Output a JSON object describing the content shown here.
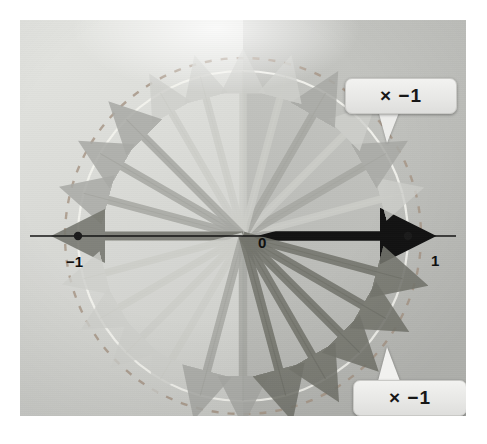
{
  "figure": {
    "title_visible": false,
    "axis_labels": {
      "negative_one": "−1",
      "zero": "0",
      "one": "1"
    },
    "callouts": [
      {
        "name": "top",
        "text": "× −1"
      },
      {
        "name": "bottom",
        "text": "× −1"
      }
    ],
    "colors": {
      "background_left": "#dcddd9",
      "background_right": "#bfc0bc",
      "axis": "#1a1a1a",
      "unit_circle": "#f0f0ec",
      "dashed_circle": "#b9a89c",
      "vector_light": "#cfd0cc",
      "vector_mid": "#a9aaa6",
      "vector_dark": "#6f706c",
      "vector_black": "#121212",
      "callout_fill": "#ececea",
      "marker": "#1a1a1a"
    },
    "geometry": {
      "origin_x": 243,
      "origin_y": 236,
      "radius": 165,
      "dashed_radius": 178
    }
  },
  "chart_data": {
    "type": "scatter",
    "title": "",
    "subtitle": "",
    "xlabel": "",
    "ylabel": "",
    "xlim": [
      -1.25,
      1.25
    ],
    "ylim": [
      -1.25,
      1.25
    ],
    "grid": false,
    "legend_position": "none",
    "tick_labels_x": [
      "−1",
      "0",
      "1"
    ],
    "tick_values_x": [
      -1,
      0,
      1
    ],
    "unit_circle_radius": 1.0,
    "dashed_circle_radius": 1.08,
    "marker_points": [
      {
        "label": "−1",
        "x": -1,
        "y": 0
      },
      {
        "label": "1",
        "x": 1,
        "y": 0
      }
    ],
    "vectors": [
      {
        "angle_deg": 0,
        "magnitude": 1.0,
        "shade": "black"
      },
      {
        "angle_deg": 15,
        "magnitude": 1.0,
        "shade": "light"
      },
      {
        "angle_deg": 30,
        "magnitude": 1.0,
        "shade": "mid"
      },
      {
        "angle_deg": 45,
        "magnitude": 1.0,
        "shade": "light"
      },
      {
        "angle_deg": 60,
        "magnitude": 1.0,
        "shade": "mid"
      },
      {
        "angle_deg": 75,
        "magnitude": 1.0,
        "shade": "light"
      },
      {
        "angle_deg": 90,
        "magnitude": 1.0,
        "shade": "light"
      },
      {
        "angle_deg": 105,
        "magnitude": 1.0,
        "shade": "light"
      },
      {
        "angle_deg": 120,
        "magnitude": 1.0,
        "shade": "light"
      },
      {
        "angle_deg": 135,
        "magnitude": 1.0,
        "shade": "mid"
      },
      {
        "angle_deg": 150,
        "magnitude": 1.0,
        "shade": "mid"
      },
      {
        "angle_deg": 165,
        "magnitude": 1.0,
        "shade": "mid"
      },
      {
        "angle_deg": 180,
        "magnitude": 1.0,
        "shade": "dark"
      },
      {
        "angle_deg": 195,
        "magnitude": 1.0,
        "shade": "light"
      },
      {
        "angle_deg": 210,
        "magnitude": 1.0,
        "shade": "light"
      },
      {
        "angle_deg": 225,
        "magnitude": 1.0,
        "shade": "light"
      },
      {
        "angle_deg": 240,
        "magnitude": 1.0,
        "shade": "light"
      },
      {
        "angle_deg": 255,
        "magnitude": 1.0,
        "shade": "mid"
      },
      {
        "angle_deg": 270,
        "magnitude": 1.0,
        "shade": "mid"
      },
      {
        "angle_deg": 285,
        "magnitude": 1.0,
        "shade": "dark"
      },
      {
        "angle_deg": 300,
        "magnitude": 1.0,
        "shade": "dark"
      },
      {
        "angle_deg": 315,
        "magnitude": 1.0,
        "shade": "dark"
      },
      {
        "angle_deg": 330,
        "magnitude": 1.0,
        "shade": "dark"
      },
      {
        "angle_deg": 345,
        "magnitude": 1.0,
        "shade": "dark"
      }
    ]
  }
}
